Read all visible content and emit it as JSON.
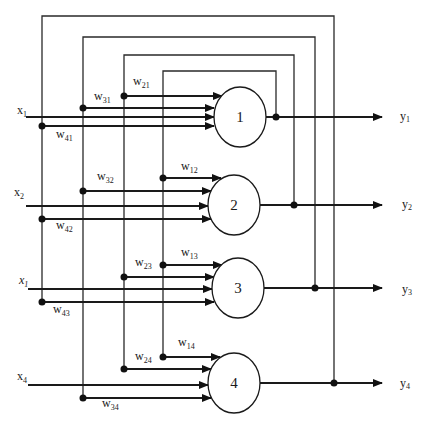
{
  "diagram": {
    "type": "recurrent neural network (Hopfield-style, 4 neurons)",
    "neurons": [
      {
        "id": "1",
        "label": "1",
        "input": {
          "var": "x",
          "sub": "1"
        },
        "output": {
          "var": "y",
          "sub": "1"
        },
        "weights": [
          {
            "var": "w",
            "sub": "21"
          },
          {
            "var": "w",
            "sub": "31"
          },
          {
            "var": "w",
            "sub": "41"
          }
        ]
      },
      {
        "id": "2",
        "label": "2",
        "input": {
          "var": "x",
          "sub": "2"
        },
        "output": {
          "var": "y",
          "sub": "2"
        },
        "weights": [
          {
            "var": "w",
            "sub": "12"
          },
          {
            "var": "w",
            "sub": "32"
          },
          {
            "var": "w",
            "sub": "42"
          }
        ]
      },
      {
        "id": "3",
        "label": "3",
        "input": {
          "var": "x",
          "sub": "1"
        },
        "output": {
          "var": "y",
          "sub": "3"
        },
        "weights": [
          {
            "var": "w",
            "sub": "13"
          },
          {
            "var": "w",
            "sub": "23"
          },
          {
            "var": "w",
            "sub": "43"
          }
        ]
      },
      {
        "id": "4",
        "label": "4",
        "input": {
          "var": "x",
          "sub": "4"
        },
        "output": {
          "var": "y",
          "sub": "4"
        },
        "weights": [
          {
            "var": "w",
            "sub": "14"
          },
          {
            "var": "w",
            "sub": "24"
          },
          {
            "var": "w",
            "sub": "34"
          }
        ]
      }
    ],
    "colors": {
      "line": "#1a1a1a",
      "background": "#ffffff"
    }
  }
}
